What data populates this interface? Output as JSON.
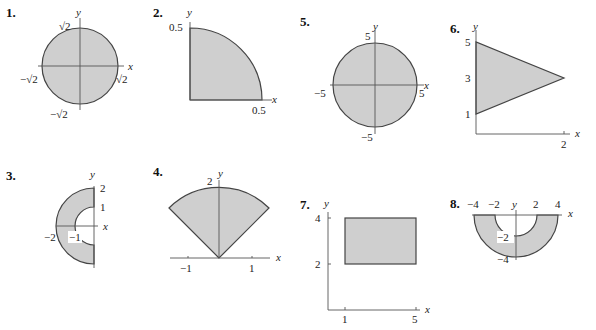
{
  "figures": [
    {
      "number": "1.",
      "shape": "disk",
      "description": "Full disk of radius sqrt(2) centered at origin",
      "labels": {
        "x_axis": "x",
        "y_axis": "y",
        "top": "√2",
        "bottom": "−√2",
        "left": "−√2",
        "right": "√2"
      }
    },
    {
      "number": "2.",
      "shape": "quarter-disk",
      "description": "Quarter disk of radius 0.5 in first quadrant",
      "labels": {
        "x_axis": "x",
        "y_axis": "y",
        "y_tick": "0.5",
        "x_tick": "0.5"
      }
    },
    {
      "number": "3.",
      "shape": "half-annulus-left",
      "description": "Left half of annulus with inner radius 1 and outer radius 2",
      "labels": {
        "x_axis": "x",
        "y_axis": "y",
        "y_tick_2": "2",
        "y_tick_1": "1",
        "x_tick_neg2": "−2",
        "x_tick_neg1": "−1"
      }
    },
    {
      "number": "4.",
      "shape": "sector",
      "description": "Sector of radius 2 between angles 45 and 135 degrees",
      "labels": {
        "x_axis": "x",
        "y_axis": "y",
        "y_tick": "2",
        "x_tick_neg1": "−1",
        "x_tick_1": "1"
      }
    },
    {
      "number": "5.",
      "shape": "disk",
      "description": "Full disk of radius 5 centered at origin",
      "labels": {
        "x_axis": "x",
        "y_axis": "y",
        "top": "5",
        "bottom": "−5",
        "left": "−5",
        "right": "5"
      }
    },
    {
      "number": "6.",
      "shape": "triangle",
      "description": "Triangle with vertices (0,1), (0,5), (2,3)",
      "labels": {
        "x_axis": "x",
        "y_axis": "y",
        "y_tick_5": "5",
        "y_tick_3": "3",
        "y_tick_1": "1",
        "x_tick_2": "2"
      }
    },
    {
      "number": "7.",
      "shape": "rectangle",
      "description": "Rectangle 1<=x<=5, 2<=y<=4",
      "labels": {
        "x_axis": "x",
        "y_axis": "y",
        "y_tick_4": "4",
        "y_tick_2": "2",
        "x_tick_1": "1",
        "x_tick_5": "5"
      }
    },
    {
      "number": "8.",
      "shape": "half-annulus-lower",
      "description": "Lower half of annulus with inner radius 2 and outer radius 4",
      "labels": {
        "x_axis": "x",
        "y_axis": "y",
        "x_tick_neg4": "−4",
        "x_tick_neg2": "−2",
        "x_tick_2": "2",
        "x_tick_4": "4",
        "y_tick_neg2": "−2",
        "y_tick_neg4": "−4"
      }
    }
  ],
  "colors": {
    "fill": "#cfcfcf",
    "stroke": "#444444",
    "axis": "#555555"
  }
}
